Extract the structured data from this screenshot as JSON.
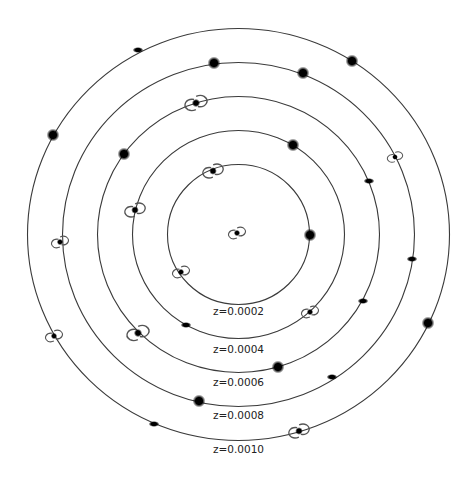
{
  "diagram": {
    "center": [
      238.5,
      234.5
    ],
    "rings": [
      {
        "label": "z=0.0002",
        "rx": 71,
        "ry": 70,
        "label_y": 315
      },
      {
        "label": "z=0.0004",
        "rx": 106,
        "ry": 104,
        "label_y": 353
      },
      {
        "label": "z=0.0006",
        "rx": 141,
        "ry": 138,
        "label_y": 386
      },
      {
        "label": "z=0.0008",
        "rx": 176,
        "ry": 172,
        "label_y": 419
      },
      {
        "label": "z=0.0010",
        "rx": 211,
        "ry": 206,
        "label_y": 453
      }
    ],
    "galaxies": [
      {
        "type": "spiral",
        "x": 237,
        "y": 233,
        "size": 1.0
      },
      {
        "type": "large-dot",
        "x": 310,
        "y": 235
      },
      {
        "type": "spiral",
        "x": 181,
        "y": 272,
        "size": 1.0
      },
      {
        "type": "spiral",
        "x": 213,
        "y": 171,
        "size": 1.2
      },
      {
        "type": "large-dot",
        "x": 293,
        "y": 145
      },
      {
        "type": "spiral",
        "x": 135,
        "y": 210,
        "size": 1.2
      },
      {
        "type": "elliptical",
        "x": 186,
        "y": 325
      },
      {
        "type": "spiral",
        "x": 310,
        "y": 312,
        "size": 1.0
      },
      {
        "type": "spiral",
        "x": 196,
        "y": 103,
        "size": 1.3
      },
      {
        "type": "large-dot",
        "x": 124,
        "y": 154
      },
      {
        "type": "elliptical",
        "x": 369,
        "y": 181
      },
      {
        "type": "spiral",
        "x": 138,
        "y": 333,
        "size": 1.3
      },
      {
        "type": "elliptical",
        "x": 363,
        "y": 301
      },
      {
        "type": "large-dot",
        "x": 278,
        "y": 367
      },
      {
        "type": "large-dot",
        "x": 214,
        "y": 63
      },
      {
        "type": "large-dot",
        "x": 303,
        "y": 73
      },
      {
        "type": "spiral",
        "x": 395,
        "y": 157,
        "size": 0.9
      },
      {
        "type": "spiral",
        "x": 60,
        "y": 242,
        "size": 1.0
      },
      {
        "type": "elliptical",
        "x": 412,
        "y": 259
      },
      {
        "type": "elliptical",
        "x": 332,
        "y": 377
      },
      {
        "type": "large-dot",
        "x": 199,
        "y": 401
      },
      {
        "type": "elliptical",
        "x": 138,
        "y": 50
      },
      {
        "type": "large-dot",
        "x": 352,
        "y": 61
      },
      {
        "type": "large-dot",
        "x": 53,
        "y": 135
      },
      {
        "type": "spiral",
        "x": 54,
        "y": 336,
        "size": 1.0
      },
      {
        "type": "large-dot",
        "x": 428,
        "y": 323
      },
      {
        "type": "elliptical",
        "x": 154,
        "y": 424
      },
      {
        "type": "spiral",
        "x": 299,
        "y": 431,
        "size": 1.2
      }
    ],
    "colors": {
      "ring": "#3a3a3a",
      "galaxy": "#000000",
      "background": "#ffffff"
    }
  }
}
